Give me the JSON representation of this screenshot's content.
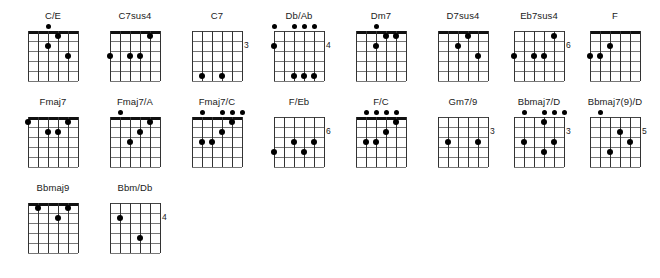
{
  "sheet": {
    "title": "guitar-chord-diagram-sheet",
    "strings": 6,
    "frets": 5,
    "dot_color": "#000000",
    "line_color": "#333333",
    "nut_color": "#111111"
  },
  "chords": [
    {
      "name": "C/E",
      "x": 10,
      "y": 10,
      "open": [
        2
      ],
      "fingers": [
        {
          "string": 3,
          "fret": 1
        },
        {
          "string": 2,
          "fret": 2
        },
        {
          "string": 4,
          "fret": 3
        }
      ],
      "fret_number": ""
    },
    {
      "name": "C7sus4",
      "x": 92,
      "y": 10,
      "open": [],
      "fingers": [
        {
          "string": 4,
          "fret": 1
        },
        {
          "string": 0,
          "fret": 3
        },
        {
          "string": 2,
          "fret": 3
        },
        {
          "string": 3,
          "fret": 3
        }
      ],
      "fret_number": ""
    },
    {
      "name": "C7",
      "x": 174,
      "y": 10,
      "open": [],
      "fingers": [
        {
          "string": 1,
          "fret": 5
        },
        {
          "string": 3,
          "fret": 5
        }
      ],
      "fret_number": "3"
    },
    {
      "name": "Db/Ab",
      "x": 256,
      "y": 10,
      "open": [
        0,
        2,
        3,
        4
      ],
      "fingers": [
        {
          "string": 0,
          "fret": 2
        },
        {
          "string": 2,
          "fret": 5
        },
        {
          "string": 3,
          "fret": 5
        },
        {
          "string": 4,
          "fret": 5
        }
      ],
      "fret_number": "4"
    },
    {
      "name": "Dm7",
      "x": 338,
      "y": 10,
      "open": [
        2
      ],
      "fingers": [
        {
          "string": 3,
          "fret": 1
        },
        {
          "string": 4,
          "fret": 1
        },
        {
          "string": 2,
          "fret": 2
        }
      ],
      "fret_number": ""
    },
    {
      "name": "D7sus4",
      "x": 420,
      "y": 10,
      "open": [],
      "fingers": [
        {
          "string": 3,
          "fret": 1
        },
        {
          "string": 2,
          "fret": 2
        },
        {
          "string": 4,
          "fret": 3
        }
      ],
      "fret_number": ""
    },
    {
      "name": "Eb7sus4",
      "x": 496,
      "y": 10,
      "open": [],
      "fingers": [
        {
          "string": 4,
          "fret": 1
        },
        {
          "string": 0,
          "fret": 3
        },
        {
          "string": 2,
          "fret": 3
        },
        {
          "string": 3,
          "fret": 3
        }
      ],
      "fret_number": "6"
    },
    {
      "name": "F",
      "x": 572,
      "y": 10,
      "open": [],
      "fingers": [
        {
          "string": 2,
          "fret": 2
        },
        {
          "string": 0,
          "fret": 3
        },
        {
          "string": 1,
          "fret": 3
        }
      ],
      "fret_number": ""
    },
    {
      "name": "Fmaj7",
      "x": 10,
      "y": 96,
      "open": [],
      "fingers": [
        {
          "string": 0,
          "fret": 1
        },
        {
          "string": 4,
          "fret": 1
        },
        {
          "string": 2,
          "fret": 2
        },
        {
          "string": 3,
          "fret": 2
        }
      ],
      "fret_number": ""
    },
    {
      "name": "Fmaj7/A",
      "x": 92,
      "y": 96,
      "open": [
        1
      ],
      "fingers": [
        {
          "string": 4,
          "fret": 1
        },
        {
          "string": 3,
          "fret": 2
        },
        {
          "string": 2,
          "fret": 3
        }
      ],
      "fret_number": ""
    },
    {
      "name": "Fmaj7/C",
      "x": 174,
      "y": 96,
      "open": [
        1,
        3,
        4,
        5
      ],
      "fingers": [
        {
          "string": 4,
          "fret": 1
        },
        {
          "string": 3,
          "fret": 2
        },
        {
          "string": 1,
          "fret": 3
        },
        {
          "string": 2,
          "fret": 3
        }
      ],
      "fret_number": ""
    },
    {
      "name": "F/Eb",
      "x": 256,
      "y": 96,
      "open": [],
      "fingers": [
        {
          "string": 2,
          "fret": 3
        },
        {
          "string": 4,
          "fret": 3
        },
        {
          "string": 0,
          "fret": 4
        },
        {
          "string": 3,
          "fret": 4
        }
      ],
      "fret_number": "6"
    },
    {
      "name": "F/C",
      "x": 338,
      "y": 96,
      "open": [
        1,
        2,
        3,
        4
      ],
      "fingers": [
        {
          "string": 4,
          "fret": 1
        },
        {
          "string": 3,
          "fret": 2
        },
        {
          "string": 1,
          "fret": 3
        },
        {
          "string": 2,
          "fret": 3
        }
      ],
      "fret_number": ""
    },
    {
      "name": "Gm7/9",
      "x": 420,
      "y": 96,
      "open": [],
      "fingers": [
        {
          "string": 1,
          "fret": 3
        },
        {
          "string": 4,
          "fret": 3
        }
      ],
      "fret_number": "3"
    },
    {
      "name": "Bbmaj7/D",
      "x": 496,
      "y": 96,
      "open": [
        1,
        3,
        4,
        5
      ],
      "fingers": [
        {
          "string": 3,
          "fret": 1
        },
        {
          "string": 1,
          "fret": 3
        },
        {
          "string": 4,
          "fret": 3
        },
        {
          "string": 3,
          "fret": 4
        }
      ],
      "fret_number": "3"
    },
    {
      "name": "Bbmaj7(9)/D",
      "x": 572,
      "y": 96,
      "open": [
        1
      ],
      "fingers": [
        {
          "string": 3,
          "fret": 2
        },
        {
          "string": 4,
          "fret": 3
        },
        {
          "string": 2,
          "fret": 4
        }
      ],
      "fret_number": "5"
    },
    {
      "name": "Bbmaj9",
      "x": 10,
      "y": 182,
      "open": [],
      "fingers": [
        {
          "string": 1,
          "fret": 1
        },
        {
          "string": 4,
          "fret": 1
        },
        {
          "string": 3,
          "fret": 2
        }
      ],
      "fret_number": ""
    },
    {
      "name": "Bbm/Db",
      "x": 92,
      "y": 182,
      "open": [],
      "fingers": [
        {
          "string": 1,
          "fret": 2
        },
        {
          "string": 3,
          "fret": 4
        }
      ],
      "fret_number": "4"
    }
  ]
}
